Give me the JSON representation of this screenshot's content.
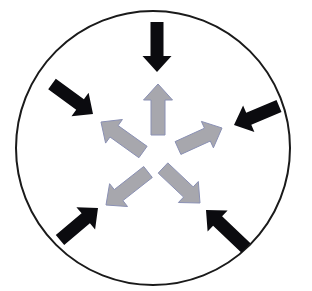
{
  "diagram": {
    "title": "Pressure balance: inward forces vs outward forces",
    "background": "#ffffff",
    "circle": {
      "cx": 153,
      "cy": 148,
      "r": 137,
      "stroke": "#1a1a1a",
      "stroke_width": 2
    },
    "colors": {
      "inward": "#0b0b0f",
      "outward_fill": "#a7a7ad",
      "outward_stroke": "#8a90b4"
    },
    "inward_arrows": [
      {
        "id": "top",
        "tail": [
          157,
          22
        ],
        "tip": [
          157,
          72
        ],
        "shaft": 13,
        "head": 29,
        "head_len": 16
      },
      {
        "id": "upper-right",
        "tail": [
          279,
          106
        ],
        "tip": [
          234,
          125
        ],
        "shaft": 13,
        "head": 29,
        "head_len": 16
      },
      {
        "id": "lower-right",
        "tail": [
          246,
          248
        ],
        "tip": [
          206,
          210
        ],
        "shaft": 13,
        "head": 29,
        "head_len": 16
      },
      {
        "id": "lower-left",
        "tail": [
          60,
          240
        ],
        "tip": [
          98,
          208
        ],
        "shaft": 13,
        "head": 29,
        "head_len": 16
      },
      {
        "id": "upper-left",
        "tail": [
          52,
          84
        ],
        "tip": [
          93,
          114
        ],
        "shaft": 13,
        "head": 29,
        "head_len": 16
      }
    ],
    "outward_arrows": [
      {
        "id": "top",
        "tail": [
          158,
          135
        ],
        "tip": [
          158,
          84
        ],
        "shaft": 14,
        "head": 29,
        "head_len": 16
      },
      {
        "id": "right",
        "tail": [
          178,
          148
        ],
        "tip": [
          222,
          128
        ],
        "shaft": 14,
        "head": 29,
        "head_len": 16
      },
      {
        "id": "lower-right",
        "tail": [
          163,
          168
        ],
        "tip": [
          200,
          203
        ],
        "shaft": 14,
        "head": 29,
        "head_len": 16
      },
      {
        "id": "lower-left",
        "tail": [
          148,
          172
        ],
        "tip": [
          106,
          205
        ],
        "shaft": 14,
        "head": 29,
        "head_len": 16
      },
      {
        "id": "upper-left",
        "tail": [
          143,
          152
        ],
        "tip": [
          101,
          122
        ],
        "shaft": 14,
        "head": 29,
        "head_len": 16
      }
    ]
  }
}
